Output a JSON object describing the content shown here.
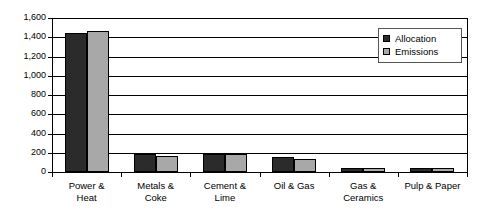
{
  "chart_data": {
    "type": "bar",
    "title": "",
    "xlabel": "",
    "ylabel": "",
    "ylim": [
      0,
      1600
    ],
    "ytick_step": 200,
    "grid": true,
    "legend_position": "top-right",
    "categories": [
      "Power & Heat",
      "Metals & Coke",
      "Cement & Lime",
      "Oil & Gas",
      "Gas & Ceramics",
      "Pulp & Paper"
    ],
    "category_lines": [
      [
        "Power &",
        "Heat"
      ],
      [
        "Metals &",
        "Coke"
      ],
      [
        "Cement &",
        "Lime"
      ],
      [
        "Oil & Gas",
        ""
      ],
      [
        "Gas &",
        "Ceramics"
      ],
      [
        "Pulp & Paper",
        ""
      ]
    ],
    "ytick_labels": [
      "1,600",
      "1,400",
      "1,200",
      "1,000",
      "800",
      "600",
      "400",
      "200",
      "0"
    ],
    "ytick_values": [
      1600,
      1400,
      1200,
      1000,
      800,
      600,
      400,
      200,
      0
    ],
    "series": [
      {
        "name": "Allocation",
        "color": "#2b2b2b",
        "values": [
          1440,
          185,
          190,
          160,
          45,
          45
        ]
      },
      {
        "name": "Emissions",
        "color": "#a8a8a8",
        "values": [
          1470,
          170,
          190,
          140,
          40,
          40
        ]
      }
    ]
  },
  "legend": {
    "items": [
      {
        "label": "Allocation",
        "color": "#2b2b2b"
      },
      {
        "label": "Emissions",
        "color": "#a8a8a8"
      }
    ]
  }
}
